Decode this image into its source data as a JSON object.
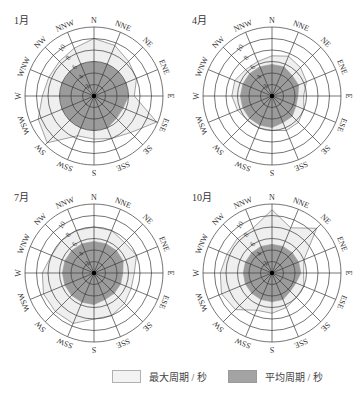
{
  "chart_data": {
    "type": "radar",
    "title": "",
    "directions": [
      "N",
      "NNE",
      "NE",
      "ENE",
      "E",
      "ESE",
      "SE",
      "SSE",
      "S",
      "SSW",
      "SW",
      "WSW",
      "W",
      "WNW",
      "NW",
      "NNW"
    ],
    "radial_ticks": [
      2,
      4,
      6,
      8,
      10
    ],
    "radial_tick_labels": [
      "2",
      "4",
      "6",
      "8",
      "10"
    ],
    "rlim": [
      0,
      12
    ],
    "grid": true,
    "legend_position": "bottom",
    "legend": [
      {
        "label": "最大周期 / 秒",
        "fill": "#efefef",
        "stroke": "#888888"
      },
      {
        "label": "平均周期 / 秒",
        "fill": "#9a9a9a",
        "stroke": "#9a9a9a"
      }
    ],
    "panels": [
      {
        "label": "1月",
        "series": [
          {
            "name": "最大周期 / 秒",
            "values": [
              10,
              9.5,
              8.5,
              8,
              7,
              11.8,
              9,
              8,
              7.5,
              7.5,
              11.5,
              10.5,
              9,
              8.5,
              8.5,
              9
            ]
          },
          {
            "name": "平均周期 / 秒",
            "values": [
              6,
              6,
              6,
              6,
              6,
              5.5,
              5.5,
              6,
              6,
              6,
              6,
              6,
              6,
              6,
              6,
              6
            ]
          }
        ]
      },
      {
        "label": "4月",
        "series": [
          {
            "name": "最大周期 / 秒",
            "values": [
              7,
              7.5,
              7,
              6.5,
              5.5,
              6,
              6.5,
              6.5,
              6,
              6,
              6,
              6.5,
              7,
              7,
              6.5,
              6.5
            ]
          },
          {
            "name": "平均周期 / 秒",
            "values": [
              5.5,
              5.5,
              5,
              5,
              4.5,
              4.5,
              5,
              5,
              5.5,
              5.5,
              5.5,
              5.5,
              5.5,
              5.5,
              5.5,
              5.5
            ]
          }
        ]
      },
      {
        "label": "7月",
        "series": [
          {
            "name": "最大周期 / 秒",
            "values": [
              8,
              8,
              7.5,
              8,
              7,
              7,
              7.5,
              8,
              8,
              9.5,
              9.5,
              9.5,
              9,
              8,
              8,
              8
            ]
          },
          {
            "name": "平均周期 / 秒",
            "values": [
              5.5,
              5.5,
              5.5,
              5.5,
              5,
              5,
              5,
              5,
              5.5,
              5.5,
              5.5,
              5.5,
              5.5,
              5.5,
              5.5,
              5.5
            ]
          }
        ]
      },
      {
        "label": "10月",
        "series": [
          {
            "name": "最大周期 / 秒",
            "values": [
              11,
              8.5,
              11,
              6,
              5.5,
              6,
              6,
              6.5,
              7,
              7,
              9,
              9.5,
              9,
              8.5,
              8.5,
              8.5
            ]
          },
          {
            "name": "平均周期 / 秒",
            "values": [
              5,
              5,
              5,
              5,
              5,
              4.5,
              4.5,
              5,
              5,
              5,
              5,
              5,
              5,
              5,
              5,
              5
            ]
          }
        ]
      }
    ]
  },
  "layout": {
    "outer_radius_px": 69,
    "centers": [
      [
        94,
        96
      ],
      [
        272,
        96
      ],
      [
        94,
        273
      ],
      [
        272,
        273
      ]
    ],
    "colors": {
      "max_fill": "#efefef",
      "max_stroke": "#8a8a8a",
      "avg_fill": "#9b9b9b",
      "grid": "#3a3a3a",
      "text": "#333333"
    }
  },
  "legend": {
    "items": [
      {
        "label": "最大周期 / 秒"
      },
      {
        "label": "平均周期 / 秒"
      }
    ]
  }
}
